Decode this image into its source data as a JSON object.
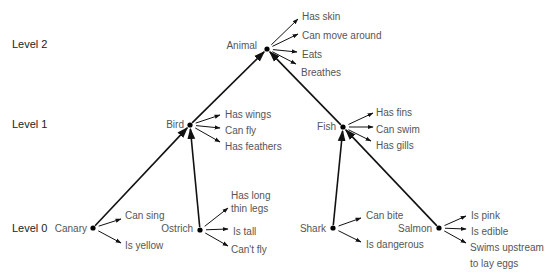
{
  "levels": [
    {
      "label": "Level 2",
      "x": 12,
      "y": 48
    },
    {
      "label": "Level 1",
      "x": 12,
      "y": 128
    },
    {
      "label": "Level 0",
      "x": 12,
      "y": 232
    }
  ],
  "nodes": [
    {
      "id": "animal",
      "label": "Animal",
      "x": 267,
      "y": 49,
      "label_x": 257,
      "label_y": 49,
      "anchor": "end",
      "properties": [
        {
          "label": "Has skin",
          "ax": 298,
          "ay": 19,
          "tx": 302,
          "ty": 17
        },
        {
          "label": "Can move around",
          "ax": 298,
          "ay": 34,
          "tx": 302,
          "ty": 36
        },
        {
          "label": "Eats",
          "ax": 297,
          "ay": 52,
          "tx": 302,
          "ty": 55
        },
        {
          "label": "Breathes",
          "ax": 296,
          "ay": 64,
          "tx": 301,
          "ty": 73
        }
      ]
    },
    {
      "id": "bird",
      "label": "Bird",
      "x": 190,
      "y": 125,
      "label_x": 184,
      "label_y": 128,
      "anchor": "end",
      "properties": [
        {
          "label": "Has wings",
          "ax": 220,
          "ay": 115,
          "tx": 225,
          "ty": 115
        },
        {
          "label": "Can fly",
          "ax": 220,
          "ay": 128,
          "tx": 225,
          "ty": 131
        },
        {
          "label": "Has feathers",
          "ax": 220,
          "ay": 142,
          "tx": 225,
          "ty": 147
        }
      ]
    },
    {
      "id": "fish",
      "label": "Fish",
      "x": 343,
      "y": 127,
      "label_x": 336,
      "label_y": 130,
      "anchor": "end",
      "properties": [
        {
          "label": "Has fins",
          "ax": 373,
          "ay": 113,
          "tx": 376,
          "ty": 113
        },
        {
          "label": "Can swim",
          "ax": 373,
          "ay": 127,
          "tx": 376,
          "ty": 130
        },
        {
          "label": "Has gills",
          "ax": 371,
          "ay": 141,
          "tx": 376,
          "ty": 146
        }
      ]
    },
    {
      "id": "canary",
      "label": "Canary",
      "x": 93,
      "y": 228,
      "label_x": 87,
      "label_y": 232,
      "anchor": "end",
      "properties": [
        {
          "label": "Can sing",
          "ax": 121,
          "ay": 219,
          "tx": 125,
          "ty": 216
        },
        {
          "label": "Is yellow",
          "ax": 121,
          "ay": 243,
          "tx": 125,
          "ty": 246
        }
      ]
    },
    {
      "id": "ostrich",
      "label": "Ostrich",
      "x": 200,
      "y": 230,
      "label_x": 193,
      "label_y": 232,
      "anchor": "end",
      "properties": [
        {
          "label": "Has long",
          "ax": 228,
          "ay": 208,
          "tx": 231,
          "ty": 196
        },
        {
          "label": "thin legs",
          "ax": null,
          "ay": null,
          "tx": 231,
          "ty": 209,
          "continuation": true
        },
        {
          "label": "Is tall",
          "ax": 228,
          "ay": 229,
          "tx": 233,
          "ty": 232
        },
        {
          "label": "Can't fly",
          "ax": 228,
          "ay": 246,
          "tx": 231,
          "ty": 250
        }
      ]
    },
    {
      "id": "shark",
      "label": "Shark",
      "x": 333,
      "y": 228,
      "label_x": 326,
      "label_y": 232,
      "anchor": "end",
      "properties": [
        {
          "label": "Can bite",
          "ax": 361,
          "ay": 218,
          "tx": 366,
          "ty": 216
        },
        {
          "label": "Is dangerous",
          "ax": 361,
          "ay": 242,
          "tx": 366,
          "ty": 245
        }
      ]
    },
    {
      "id": "salmon",
      "label": "Salmon",
      "x": 439,
      "y": 228,
      "label_x": 432,
      "label_y": 232,
      "anchor": "end",
      "properties": [
        {
          "label": "Is pink",
          "ax": 466,
          "ay": 216,
          "tx": 471,
          "ty": 216
        },
        {
          "label": "Is edible",
          "ax": 466,
          "ay": 229,
          "tx": 471,
          "ty": 232
        },
        {
          "label": "Swims upstream",
          "ax": 466,
          "ay": 243,
          "tx": 470,
          "ty": 248
        },
        {
          "label": "to lay eggs",
          "ax": null,
          "ay": null,
          "tx": 470,
          "ty": 264,
          "continuation": true
        }
      ]
    }
  ],
  "edges": [
    {
      "from": "canary",
      "to": "bird"
    },
    {
      "from": "ostrich",
      "to": "bird"
    },
    {
      "from": "shark",
      "to": "fish"
    },
    {
      "from": "salmon",
      "to": "fish"
    },
    {
      "from": "bird",
      "to": "animal"
    },
    {
      "from": "fish",
      "to": "animal"
    }
  ]
}
